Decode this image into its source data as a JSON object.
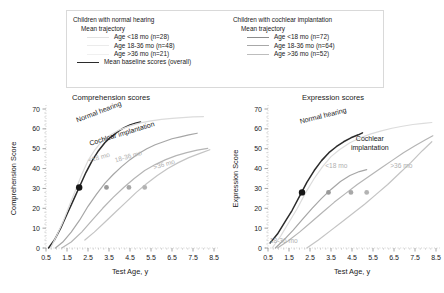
{
  "legend": {
    "normal": {
      "heading": "Children with normal hearing",
      "subheading": "Mean trajectory",
      "items": [
        {
          "label": "Age <18 mo (n=28)",
          "color": "#e2e2e2"
        },
        {
          "label": "Age 18-36 mo (n=48)",
          "color": "#ebebeb"
        },
        {
          "label": "Age >36 mo (n=21)",
          "color": "#f0f0f0"
        }
      ],
      "baseline": {
        "label": "Mean baseline scores (overall)",
        "color": "#2b2b2b"
      }
    },
    "implant": {
      "heading": "Children with cochlear implantation",
      "subheading": "Mean trajectory",
      "items": [
        {
          "label": "Age <18 mo (n=72)",
          "color": "#8c8c8c"
        },
        {
          "label": "Age 18-36 mo (n=64)",
          "color": "#a8a8a8"
        },
        {
          "label": "Age >36 mo (n=52)",
          "color": "#bdbdbd"
        }
      ]
    }
  },
  "chart_data": [
    {
      "type": "line",
      "title": "Comprehension scores",
      "xlabel": "Test Age, y",
      "ylabel": "Comprehension Score",
      "xlim": [
        0.5,
        8.5
      ],
      "ylim": [
        0,
        70
      ],
      "xticks": [
        0.5,
        1.5,
        2.5,
        3.5,
        4.5,
        5.5,
        6.5,
        7.5,
        8.5
      ],
      "yticks": [
        0,
        10,
        20,
        30,
        40,
        50,
        60,
        70
      ],
      "grid": false,
      "annotations": [
        {
          "text": "Normal hearing",
          "x": 3.05,
          "y": 67.5,
          "style": "dark",
          "rotate": -21
        },
        {
          "text": "Cochlear implantation",
          "x": 4.15,
          "y": 56.5,
          "style": "dark",
          "rotate": -17
        },
        {
          "text": "<18 mo",
          "x": 3.05,
          "y": 44.5,
          "style": "light",
          "rotate": -16
        },
        {
          "text": "18-36 mo",
          "x": 4.45,
          "y": 45.0,
          "style": "light",
          "rotate": -16
        },
        {
          "text": ">36 mo",
          "x": 6.15,
          "y": 41.0,
          "style": "light",
          "rotate": -16
        }
      ],
      "series": [
        {
          "name": "Normal hearing mean baseline",
          "color": "#2b2b2b",
          "width": 1.5,
          "points": [
            [
              0.62,
              0
            ],
            [
              0.9,
              4
            ],
            [
              1.2,
              10
            ],
            [
              1.5,
              17
            ],
            [
              1.8,
              24
            ],
            [
              2.1,
              31
            ],
            [
              2.4,
              38
            ],
            [
              2.7,
              44
            ],
            [
              3.0,
              49
            ],
            [
              3.3,
              53
            ],
            [
              3.6,
              56
            ],
            [
              3.9,
              58.5
            ],
            [
              4.2,
              60.5
            ],
            [
              4.5,
              62
            ],
            [
              4.8,
              63
            ],
            [
              5.0,
              63.5
            ]
          ],
          "marker": {
            "x": 2.08,
            "y": 30.5,
            "color": "#161616",
            "size": 3.2
          }
        },
        {
          "name": "Normal hearing <18 mo",
          "color": "#dcdcdc",
          "width": 1.2,
          "points": [
            [
              0.72,
              0
            ],
            [
              1.0,
              6
            ],
            [
              1.3,
              13
            ],
            [
              1.6,
              21
            ],
            [
              1.9,
              29
            ],
            [
              2.2,
              37
            ],
            [
              2.5,
              44
            ],
            [
              2.8,
              49
            ],
            [
              3.1,
              53
            ],
            [
              3.5,
              56.5
            ],
            [
              4.0,
              59.5
            ],
            [
              4.5,
              61.5
            ],
            [
              5.0,
              63
            ],
            [
              5.5,
              64
            ],
            [
              6.0,
              64.8
            ],
            [
              6.5,
              65.3
            ],
            [
              7.0,
              65.7
            ],
            [
              7.5,
              66
            ],
            [
              8.0,
              66.2
            ]
          ],
          "marker": null
        },
        {
          "name": "Implant <18 mo",
          "color": "#a6a6a6",
          "width": 1.2,
          "points": [
            [
              0.95,
              0
            ],
            [
              1.3,
              3
            ],
            [
              1.7,
              8
            ],
            [
              2.1,
              14
            ],
            [
              2.5,
              21
            ],
            [
              2.9,
              27
            ],
            [
              3.3,
              32.5
            ],
            [
              3.7,
              37
            ],
            [
              4.1,
              41
            ],
            [
              4.5,
              44.5
            ],
            [
              4.9,
              47.5
            ],
            [
              5.3,
              50
            ],
            [
              5.7,
              52
            ],
            [
              6.1,
              53.5
            ],
            [
              6.5,
              55
            ],
            [
              6.9,
              56
            ],
            [
              7.3,
              57
            ],
            [
              7.7,
              57.8
            ]
          ],
          "marker": {
            "x": 3.38,
            "y": 30.5,
            "color": "#9a9a9a",
            "size": 2.4
          }
        },
        {
          "name": "Implant 18-36 mo",
          "color": "#b5b5b5",
          "width": 1.2,
          "points": [
            [
              1.25,
              0
            ],
            [
              1.7,
              3
            ],
            [
              2.2,
              8
            ],
            [
              2.7,
              14
            ],
            [
              3.2,
              20
            ],
            [
              3.7,
              25.5
            ],
            [
              4.2,
              30.5
            ],
            [
              4.7,
              35
            ],
            [
              5.2,
              39
            ],
            [
              5.7,
              42
            ],
            [
              6.2,
              44.5
            ],
            [
              6.7,
              46.5
            ],
            [
              7.2,
              48
            ],
            [
              7.7,
              49.3
            ],
            [
              8.2,
              50.2
            ]
          ],
          "marker": {
            "x": 4.45,
            "y": 30.5,
            "color": "#a8a8a8",
            "size": 2.4
          }
        },
        {
          "name": "Implant >36 mo",
          "color": "#c4c4c4",
          "width": 1.2,
          "points": [
            [
              2.35,
              4
            ],
            [
              2.8,
              8
            ],
            [
              3.3,
              13
            ],
            [
              3.8,
              18
            ],
            [
              4.3,
              23
            ],
            [
              4.8,
              28
            ],
            [
              5.3,
              32.5
            ],
            [
              5.8,
              36.5
            ],
            [
              6.3,
              40
            ],
            [
              6.8,
              43
            ],
            [
              7.3,
              45.5
            ],
            [
              7.8,
              47.5
            ],
            [
              8.3,
              49.5
            ]
          ],
          "marker": {
            "x": 5.2,
            "y": 30.5,
            "color": "#b3b3b3",
            "size": 2.4
          }
        }
      ]
    },
    {
      "type": "line",
      "title": "Expression scores",
      "xlabel": "Test Age, y",
      "ylabel": "Expression Score",
      "xlim": [
        0.5,
        8.5
      ],
      "ylim": [
        0,
        70
      ],
      "xticks": [
        0.5,
        1.5,
        2.5,
        3.5,
        4.5,
        5.5,
        6.5,
        7.5,
        8.5
      ],
      "yticks": [
        0,
        10,
        20,
        30,
        40,
        50,
        60,
        70
      ],
      "grid": false,
      "annotations": [
        {
          "text": "Normal hearing",
          "x": 3.15,
          "y": 65.5,
          "style": "dark",
          "rotate": -14
        },
        {
          "text": "Cochlear",
          "x": 5.35,
          "y": 54.0,
          "style": "dark",
          "rotate": 0
        },
        {
          "text": "implantation",
          "x": 5.35,
          "y": 49.5,
          "style": "dark",
          "rotate": 0
        },
        {
          "text": "<18 mo",
          "x": 3.75,
          "y": 40.5,
          "style": "light",
          "rotate": 0
        },
        {
          "text": ">36 mo",
          "x": 6.85,
          "y": 40.5,
          "style": "light",
          "rotate": 0
        },
        {
          "text": "18-36 mo",
          "x": 1.25,
          "y": 2.5,
          "style": "light",
          "rotate": 0
        }
      ],
      "series": [
        {
          "name": "Normal hearing mean baseline",
          "color": "#2b2b2b",
          "width": 1.5,
          "points": [
            [
              0.6,
              2.5
            ],
            [
              0.95,
              7
            ],
            [
              1.3,
              13
            ],
            [
              1.65,
              19
            ],
            [
              2.0,
              26
            ],
            [
              2.35,
              33
            ],
            [
              2.7,
              39
            ],
            [
              3.05,
              44
            ],
            [
              3.4,
              48
            ],
            [
              3.75,
              51
            ],
            [
              4.1,
              53.5
            ],
            [
              4.45,
              55.5
            ],
            [
              4.8,
              57
            ],
            [
              5.0,
              58
            ]
          ],
          "marker": {
            "x": 2.12,
            "y": 28.0,
            "color": "#161616",
            "size": 3.2
          }
        },
        {
          "name": "Normal hearing <18 mo",
          "color": "#dcdcdc",
          "width": 1.2,
          "points": [
            [
              0.7,
              0
            ],
            [
              1.1,
              6
            ],
            [
              1.5,
              13
            ],
            [
              1.9,
              20
            ],
            [
              2.3,
              28
            ],
            [
              2.7,
              35
            ],
            [
              3.1,
              41
            ],
            [
              3.5,
              46
            ],
            [
              3.9,
              49.5
            ],
            [
              4.4,
              53
            ],
            [
              4.9,
              55.5
            ],
            [
              5.4,
              57.5
            ],
            [
              5.9,
              59
            ],
            [
              6.4,
              60.3
            ],
            [
              6.9,
              61.3
            ],
            [
              7.4,
              62.2
            ],
            [
              7.9,
              62.8
            ],
            [
              8.3,
              63.2
            ]
          ],
          "marker": null
        },
        {
          "name": "Implant <18 mo",
          "color": "#a6a6a6",
          "width": 1.2,
          "points": [
            [
              0.85,
              0
            ],
            [
              1.25,
              4
            ],
            [
              1.7,
              9
            ],
            [
              2.15,
              14.5
            ],
            [
              2.6,
              20
            ],
            [
              3.05,
              25
            ],
            [
              3.5,
              29.5
            ],
            [
              3.95,
              33.5
            ],
            [
              4.4,
              36.5
            ],
            [
              4.85,
              38.5
            ],
            [
              5.2,
              39.5
            ]
          ],
          "marker": {
            "x": 3.38,
            "y": 28.0,
            "color": "#9a9a9a",
            "size": 2.4
          }
        },
        {
          "name": "Implant 18-36 mo",
          "color": "#b5b5b5",
          "width": 1.2,
          "points": [
            [
              0.95,
              0
            ],
            [
              1.45,
              3.5
            ],
            [
              2.0,
              8
            ],
            [
              2.55,
              13
            ],
            [
              3.1,
              18
            ],
            [
              3.65,
              23
            ],
            [
              4.2,
              27.5
            ],
            [
              4.75,
              32
            ],
            [
              5.3,
              36
            ],
            [
              5.85,
              40
            ],
            [
              6.4,
              44
            ],
            [
              6.95,
              48
            ],
            [
              7.5,
              51.5
            ],
            [
              8.0,
              54.5
            ],
            [
              8.35,
              56.5
            ]
          ],
          "marker": {
            "x": 4.45,
            "y": 28.0,
            "color": "#a8a8a8",
            "size": 2.4
          }
        },
        {
          "name": "Implant >36 mo",
          "color": "#c4c4c4",
          "width": 1.2,
          "points": [
            [
              2.35,
              0
            ],
            [
              2.9,
              4
            ],
            [
              3.45,
              8.5
            ],
            [
              4.0,
              13
            ],
            [
              4.55,
              17.5
            ],
            [
              5.1,
              22
            ],
            [
              5.65,
              27
            ],
            [
              6.2,
              32
            ],
            [
              6.75,
              37.5
            ],
            [
              7.3,
              43
            ],
            [
              7.85,
              49
            ],
            [
              8.3,
              53.5
            ]
          ],
          "marker": {
            "x": 5.2,
            "y": 28.0,
            "color": "#b3b3b3",
            "size": 2.4
          }
        }
      ]
    }
  ]
}
